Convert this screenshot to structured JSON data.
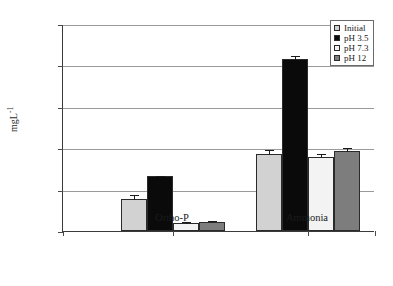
{
  "chart_data": {
    "type": "bar",
    "title": "",
    "xlabel": "",
    "ylabel": "mgL",
    "ylabel_sup": "-1",
    "ylim": [
      0,
      250
    ],
    "yticks": [
      0,
      50,
      100,
      150,
      200,
      250
    ],
    "ytick_labels": [
      "0",
      "50",
      "100",
      "150",
      "200",
      "250"
    ],
    "grid": true,
    "legend_position": "top-right",
    "categories": [
      "Ortho-P",
      "Ammonia"
    ],
    "series": [
      {
        "name": "Initial",
        "color": "#d2d2d2",
        "values": [
          39,
          93
        ],
        "errors": [
          6,
          6
        ]
      },
      {
        "name": "pH 3.5",
        "color": "#0a0a0a",
        "values": [
          66,
          208
        ],
        "errors": [
          2,
          4
        ]
      },
      {
        "name": "pH 7.3",
        "color": "#f3f3f3",
        "values": [
          10,
          89
        ],
        "errors": [
          2,
          5
        ]
      },
      {
        "name": "pH 12",
        "color": "#7d7d7d",
        "values": [
          11,
          97
        ],
        "errors": [
          2,
          4
        ]
      }
    ]
  },
  "legend": {
    "items": [
      {
        "label": "Initial",
        "color": "#d2d2d2"
      },
      {
        "label": "pH 3.5",
        "color": "#0a0a0a"
      },
      {
        "label": "pH 7.3",
        "color": "#f3f3f3"
      },
      {
        "label": "pH 12",
        "color": "#7d7d7d"
      }
    ]
  },
  "axis": {
    "y_label_text": "mgL",
    "y_label_exponent": "-1",
    "y_ticks": [
      "250",
      "200",
      "150",
      "100",
      "50",
      "0"
    ],
    "x_categories": [
      "Ortho-P",
      "Ammonia"
    ]
  },
  "caption": {
    "text": ""
  }
}
